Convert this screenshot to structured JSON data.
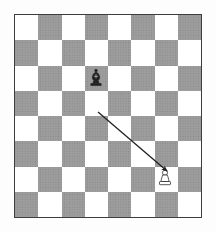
{
  "figure": {
    "kind": "chess-diagram",
    "board": {
      "files": 8,
      "ranks": 8,
      "orientation": "white-bottom",
      "top_left_square_color": "light",
      "light_square_color": "#ffffff",
      "dark_square_color": "#b4b4b4",
      "dark_square_fill_style": "crosshatch-hatching",
      "border_color": "#3a3a3a",
      "background_color": "#fdfdfd"
    },
    "pieces": [
      {
        "id": "black-bishop",
        "type": "bishop",
        "color": "black",
        "glyph": "bishop-black-icon",
        "file_index": 3,
        "rank_index": 2,
        "square_color": "light",
        "fill": "#1d1d1d"
      },
      {
        "id": "white-pawn",
        "type": "pawn",
        "color": "white",
        "glyph": "pawn-white-icon",
        "file_index": 6,
        "rank_index": 6,
        "square_color": "light",
        "fill": "#ffffff",
        "stroke": "#1d1d1d"
      }
    ],
    "arrow": {
      "id": "capture-arrow",
      "from_piece": "black-bishop",
      "to_piece": "white-pawn",
      "start_x": 98,
      "start_y": 112,
      "end_x": 167,
      "end_y": 171,
      "color": "#1d1d1d",
      "line_width": 1.3,
      "head_style": "filled-triangle"
    }
  }
}
